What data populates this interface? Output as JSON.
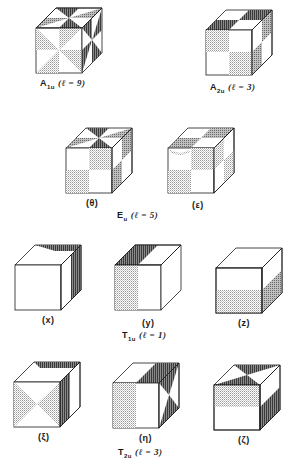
{
  "figure": {
    "colors": {
      "ink": "#1a1a1a",
      "light_shade": "#b8b8b8",
      "dark_shade": "#5a5a5a",
      "background": "#ffffff"
    },
    "groups": [
      {
        "id": "A1u",
        "rep": "A",
        "sub": "1u",
        "l_label": "(ℓ = 9)",
        "cubes": [
          {
            "id": "A1u",
            "caption": ""
          }
        ]
      },
      {
        "id": "A2u",
        "rep": "A",
        "sub": "2u",
        "l_label": "(ℓ = 3)",
        "cubes": [
          {
            "id": "A2u",
            "caption": ""
          }
        ]
      },
      {
        "id": "Eu",
        "rep": "E",
        "sub": "u",
        "l_label": "(ℓ = 5)",
        "cubes": [
          {
            "id": "theta",
            "caption": "(θ)"
          },
          {
            "id": "epsilon",
            "caption": "(ε)"
          }
        ]
      },
      {
        "id": "T1u",
        "rep": "T",
        "sub": "1u",
        "l_label": "(ℓ = 1)",
        "cubes": [
          {
            "id": "x",
            "caption": "(x)"
          },
          {
            "id": "y",
            "caption": "(y)"
          },
          {
            "id": "z",
            "caption": "(z)"
          }
        ]
      },
      {
        "id": "T2u",
        "rep": "T",
        "sub": "2u",
        "l_label": "(ℓ = 3)",
        "cubes": [
          {
            "id": "xi",
            "caption": "(ξ)"
          },
          {
            "id": "eta",
            "caption": "(η)"
          },
          {
            "id": "zeta",
            "caption": "(ζ)"
          }
        ]
      }
    ]
  }
}
